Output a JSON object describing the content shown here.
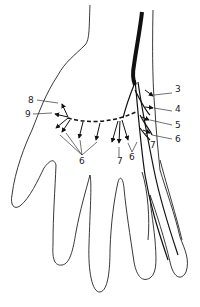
{
  "diagram": {
    "labels": [
      {
        "id": "3",
        "text": "3",
        "x": 175,
        "y": 89
      },
      {
        "id": "4",
        "text": "4",
        "x": 175,
        "y": 108
      },
      {
        "id": "5",
        "text": "5",
        "x": 175,
        "y": 122
      },
      {
        "id": "6r",
        "text": "6",
        "x": 175,
        "y": 136
      },
      {
        "id": "7r",
        "text": "7",
        "x": 149,
        "y": 142
      },
      {
        "id": "8",
        "text": "8",
        "x": 29,
        "y": 96
      },
      {
        "id": "9",
        "text": "9",
        "x": 25,
        "y": 110
      },
      {
        "id": "6l",
        "text": "6",
        "x": 79,
        "y": 158
      },
      {
        "id": "7m",
        "text": "7",
        "x": 117,
        "y": 158
      },
      {
        "id": "6m",
        "text": "6",
        "x": 130,
        "y": 154
      }
    ]
  }
}
